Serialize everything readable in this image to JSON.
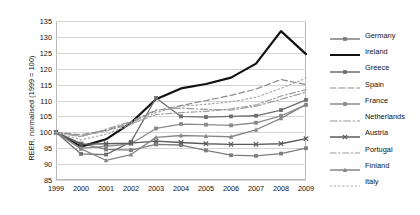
{
  "chart_data": {
    "type": "line",
    "title": "",
    "xlabel": "",
    "ylabel": "REER, normalised (1999 = 100)",
    "x": [
      1999,
      2000,
      2001,
      2002,
      2003,
      2004,
      2005,
      2006,
      2007,
      2008,
      2009
    ],
    "xlim": [
      1999,
      2009
    ],
    "ylim": [
      85,
      135
    ],
    "yticks": [
      85,
      90,
      95,
      100,
      105,
      110,
      115,
      120,
      125,
      130,
      135
    ],
    "xticks": [
      "1999",
      "2000",
      "2001",
      "2002",
      "2003",
      "2004",
      "2005",
      "2006",
      "2007",
      "2008",
      "2009"
    ],
    "grid": true,
    "legend_position": "right",
    "series": [
      {
        "name": "Germany",
        "color": "#7d7d7d",
        "width": 1.3,
        "dash": "none",
        "marker": "square",
        "values": [
          100,
          96.5,
          94.6,
          94.4,
          96.2,
          96.0,
          94.3,
          92.8,
          92.6,
          93.3,
          95.0
        ]
      },
      {
        "name": "Ireland",
        "color": "#111111",
        "width": 2.2,
        "dash": "none",
        "marker": "none",
        "values": [
          100,
          95.5,
          97.8,
          103.0,
          110.4,
          113.8,
          115.2,
          117.2,
          121.6,
          131.8,
          124.6
        ]
      },
      {
        "name": "Greece",
        "color": "#6e6e6e",
        "width": 1.3,
        "dash": "none",
        "marker": "square",
        "values": [
          100,
          93.2,
          93.0,
          97.0,
          110.8,
          105.0,
          104.8,
          105.0,
          105.2,
          107.0,
          110.2
        ]
      },
      {
        "name": "Spain",
        "color": "#8c8c8c",
        "width": 1.2,
        "dash": "dashed",
        "marker": "none",
        "values": [
          100,
          99.2,
          100.6,
          103.0,
          106.8,
          108.4,
          110.0,
          111.6,
          113.6,
          116.6,
          115.0
        ]
      },
      {
        "name": "France",
        "color": "#8a8a8a",
        "width": 1.3,
        "dash": "none",
        "marker": "square",
        "values": [
          100,
          95.0,
          95.6,
          96.4,
          101.2,
          102.6,
          102.4,
          102.2,
          103.0,
          105.2,
          108.6
        ]
      },
      {
        "name": "Netherlands",
        "color": "#9a9a9a",
        "width": 1.2,
        "dash": "dashdot",
        "marker": "none",
        "values": [
          100,
          98.6,
          101.0,
          103.4,
          107.0,
          107.6,
          107.2,
          107.0,
          108.2,
          110.4,
          112.6
        ]
      },
      {
        "name": "Austria",
        "color": "#5a5a5a",
        "width": 1.3,
        "dash": "none",
        "marker": "x",
        "values": [
          100,
          96.2,
          96.4,
          96.6,
          97.2,
          96.8,
          96.4,
          96.2,
          96.2,
          96.4,
          98.0
        ]
      },
      {
        "name": "Portugal",
        "color": "#9e9e9e",
        "width": 1.2,
        "dash": "dashdot2",
        "marker": "none",
        "values": [
          100,
          98.8,
          100.4,
          102.6,
          105.6,
          106.2,
          106.6,
          107.4,
          108.6,
          111.4,
          113.4
        ]
      },
      {
        "name": "Finland",
        "color": "#868686",
        "width": 1.3,
        "dash": "none",
        "marker": "triangle",
        "values": [
          100,
          94.8,
          91.2,
          93.0,
          98.4,
          99.0,
          98.8,
          98.6,
          100.8,
          104.4,
          108.8
        ]
      },
      {
        "name": "Italy",
        "color": "#a8a8a8",
        "width": 1.2,
        "dash": "dotted",
        "marker": "none",
        "values": [
          100,
          97.6,
          99.4,
          102.4,
          106.2,
          108.2,
          108.8,
          109.6,
          111.0,
          113.8,
          117.0
        ]
      }
    ]
  }
}
